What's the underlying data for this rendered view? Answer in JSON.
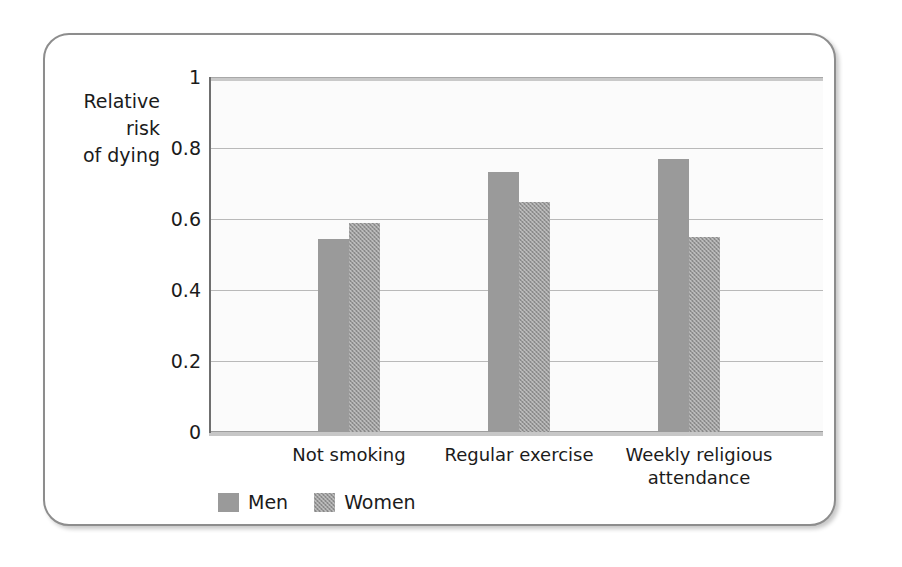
{
  "figure": {
    "frame_border_color": "#8d8d8d",
    "background_color": "#ffffff"
  },
  "chart_data": {
    "type": "bar",
    "title": "",
    "subtitle": "",
    "xlabel": "",
    "ylabel": "Relative risk of dying",
    "ylabel_lines": [
      "Relative",
      "risk",
      "of dying"
    ],
    "categories": [
      "Not smoking",
      "Regular exercise",
      "Weekly religious attendance"
    ],
    "category_label_lines": [
      [
        "Not smoking"
      ],
      [
        "Regular exercise"
      ],
      [
        "Weekly religious",
        "attendance"
      ]
    ],
    "series": [
      {
        "name": "Men",
        "color": "#9a9a9a",
        "pattern": "solid",
        "values": [
          0.545,
          0.735,
          0.77
        ]
      },
      {
        "name": "Women",
        "color": "#9a9a9a",
        "pattern": "checkered",
        "values": [
          0.59,
          0.65,
          0.55
        ]
      }
    ],
    "ylim": [
      0,
      1
    ],
    "yticks": [
      0,
      0.2,
      0.4,
      0.6,
      0.8,
      1
    ],
    "ytick_labels": [
      "0",
      "0.2",
      "0.4",
      "0.6",
      "0.8",
      "1"
    ],
    "grid": true,
    "grid_color": "#b9b9b9",
    "legend_position": "bottom-left",
    "legend": [
      "Men",
      "Women"
    ]
  }
}
